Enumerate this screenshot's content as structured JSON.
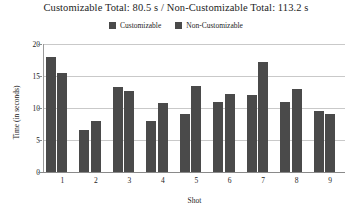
{
  "chart_data": {
    "type": "bar",
    "title": "Customizable Total: 80.5 s / Non-Customizable Total: 113.2 s",
    "xlabel": "Shot",
    "ylabel": "Time (in seconds)",
    "categories": [
      "1",
      "2",
      "3",
      "4",
      "5",
      "6",
      "7",
      "8",
      "9"
    ],
    "series": [
      {
        "name": "Customizable",
        "color": "#4a4a4a",
        "values": [
          18.0,
          6.5,
          13.3,
          8.0,
          9.0,
          11.0,
          12.0,
          11.0,
          9.5
        ]
      },
      {
        "name": "Non-Customizable",
        "color": "#4a4a4a",
        "values": [
          15.5,
          8.0,
          12.7,
          10.8,
          13.5,
          12.2,
          17.2,
          13.0,
          9.0
        ]
      }
    ],
    "ylim": [
      0,
      20
    ],
    "yticks": [
      "0",
      "5",
      "10",
      "15",
      "20"
    ],
    "ytick_values": [
      0,
      5,
      10,
      15,
      20
    ],
    "grid": true,
    "legend_position": "top-center",
    "totals": {
      "customizable": "80.5 s",
      "non_customizable": "113.2 s"
    }
  },
  "legend": {
    "entries": [
      {
        "label": "Customizable",
        "color": "#4a4a4a"
      },
      {
        "label": "Non-Customizable",
        "color": "#4a4a4a"
      }
    ]
  }
}
